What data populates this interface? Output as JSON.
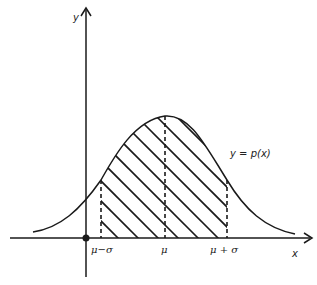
{
  "diagram": {
    "type": "normal distribution curve with shaded area between mu-sigma and mu+sigma",
    "axes": {
      "x_label": "x",
      "y_label": "y"
    },
    "curve_label": "y = p(x)",
    "ticks": [
      {
        "id": "mu_minus_sigma",
        "label": "μ−σ"
      },
      {
        "id": "mu",
        "label": "μ"
      },
      {
        "id": "mu_plus_sigma",
        "label": "μ + σ"
      }
    ],
    "shaded_region": {
      "from": "μ−σ",
      "to": "μ + σ",
      "pattern": "diagonal hatch"
    },
    "colors": {
      "stroke": "#1a1a1a",
      "background": "#ffffff"
    }
  }
}
